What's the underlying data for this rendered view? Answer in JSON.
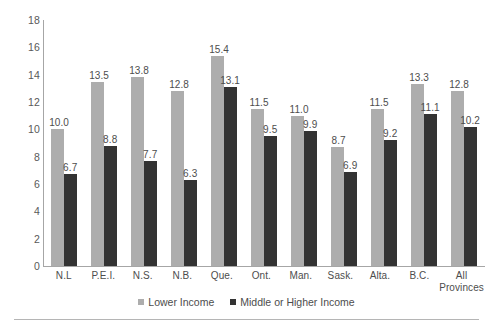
{
  "chart_data": {
    "type": "bar",
    "title": "",
    "subtitle": "",
    "xlabel": "",
    "ylabel": "",
    "ylim": [
      0,
      18
    ],
    "ytick_step": 2,
    "yticks": [
      "0",
      "2",
      "4",
      "6",
      "8",
      "10",
      "12",
      "14",
      "16",
      "18"
    ],
    "grid": false,
    "legend_position": "bottom",
    "categories": [
      "N.L",
      "P.E.I.",
      "N.S.",
      "N.B.",
      "Que.",
      "Ont.",
      "Man.",
      "Sask.",
      "Alta.",
      "B.C.",
      "All Provinces"
    ],
    "category_lines": [
      [
        "N.L"
      ],
      [
        "P.E.I."
      ],
      [
        "N.S."
      ],
      [
        "N.B."
      ],
      [
        "Que."
      ],
      [
        "Ont."
      ],
      [
        "Man."
      ],
      [
        "Sask."
      ],
      [
        "Alta."
      ],
      [
        "B.C."
      ],
      [
        "All",
        "Provinces"
      ]
    ],
    "series": [
      {
        "name": "Lower Income",
        "color": "#adadad",
        "values": [
          10.0,
          13.5,
          13.8,
          12.8,
          15.4,
          11.5,
          11.0,
          8.7,
          11.5,
          13.3,
          12.8
        ],
        "labels": [
          "10.0",
          "13.5",
          "13.8",
          "12.8",
          "15.4",
          "11.5",
          "11.0",
          "8.7",
          "11.5",
          "13.3",
          "12.8"
        ]
      },
      {
        "name": "Middle or Higher Income",
        "color": "#333333",
        "values": [
          6.7,
          8.8,
          7.7,
          6.3,
          13.1,
          9.5,
          9.9,
          6.9,
          9.2,
          11.1,
          10.2
        ],
        "labels": [
          "6.7",
          "8.8",
          "7.7",
          "6.3",
          "13.1",
          "9.5",
          "9.9",
          "6.9",
          "9.2",
          "11.1",
          "10.2"
        ]
      }
    ]
  },
  "legend": {
    "items": [
      {
        "label": "Lower Income",
        "color": "#adadad"
      },
      {
        "label": "Middle or Higher Income",
        "color": "#333333"
      }
    ]
  },
  "axis": {
    "line_color": "#a6a6a6"
  }
}
